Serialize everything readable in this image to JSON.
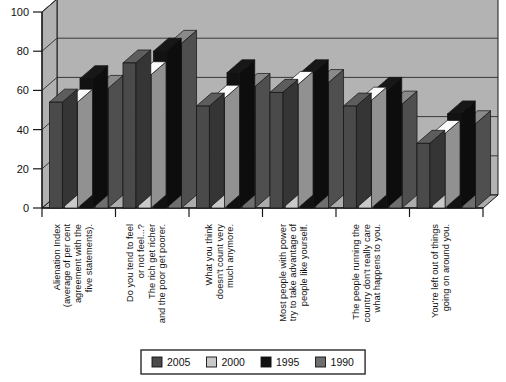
{
  "chart_data": {
    "type": "bar",
    "title": "",
    "subtitle": "",
    "xlabel": "",
    "ylabel": "",
    "ylim": [
      0,
      100
    ],
    "yticks": [
      0,
      20,
      40,
      60,
      80,
      100
    ],
    "grid": true,
    "three_d": true,
    "legend_position": "bottom",
    "categories": [
      "Alienation Index\n(average of per cent\nagreement with the\nfive statements).",
      "Do you tend to feel\nor not feel...?\nThe rich get richer\nand the poor get poorer.",
      "What you think\ndoesn't count very\nmuch anymore.",
      "Most people with power\ntry to take advantage of\npeople like yourself.",
      "The people running the\ncountry don't really care\nwhat happens to you.",
      "You're left out of things\ngoing on around you."
    ],
    "series": [
      {
        "name": "2005",
        "color": "#4a4a4a",
        "values": [
          54,
          74,
          52,
          59,
          52,
          33
        ]
      },
      {
        "name": "2000",
        "color": "#c9c9c9",
        "values": [
          54,
          68,
          56,
          63,
          55,
          38
        ]
      },
      {
        "name": "1995",
        "color": "#121212",
        "values": [
          66,
          80,
          69,
          69,
          60,
          48
        ]
      },
      {
        "name": "1990",
        "color": "#6e6e6e",
        "values": [
          61,
          84,
          62,
          64,
          53,
          43
        ]
      }
    ]
  },
  "axes": {
    "y_tick_labels": [
      "0",
      "20",
      "40",
      "60",
      "80",
      "100"
    ]
  },
  "categories_lines": [
    [
      "Alienation Index",
      "(average of per cent",
      "agreement with the",
      "five statements)."
    ],
    [
      "Do you tend to feel",
      "or not feel...?",
      "The rich get richer",
      "and the poor get poorer."
    ],
    [
      "What you think",
      "doesn't count very",
      "much anymore."
    ],
    [
      "Most people with power",
      "try to take advantage of",
      "people like yourself."
    ],
    [
      "The people running the",
      "country don't really care",
      "what happens to you."
    ],
    [
      "You're left out of things",
      "going on around you."
    ]
  ],
  "legend": {
    "items": [
      {
        "label": "2005",
        "color": "#4a4a4a"
      },
      {
        "label": "2000",
        "color": "#c9c9c9"
      },
      {
        "label": "1995",
        "color": "#121212"
      },
      {
        "label": "1990",
        "color": "#6e6e6e"
      }
    ]
  },
  "colors": {
    "plot_background": "#b3b3b3",
    "page_background": "#ffffff",
    "grid_line": "#2b2b2b",
    "axis_line": "#1a1a1a",
    "legend_border": "#1a1a1a"
  }
}
